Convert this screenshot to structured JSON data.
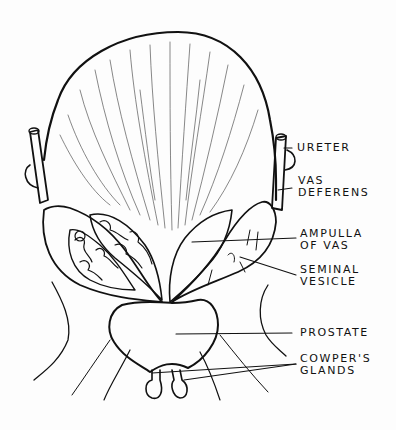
{
  "diagram": {
    "labels": {
      "ureter": {
        "line1": "URETER"
      },
      "vas_deferens": {
        "line1": "VAS",
        "line2": "DEFERENS"
      },
      "ampulla_of_vas": {
        "line1": "AMPULLA",
        "line2": "OF VAS"
      },
      "seminal_vesicle": {
        "line1": "SEMINAL",
        "line2": "VESICLE"
      },
      "prostate": {
        "line1": "PROSTATE"
      },
      "cowpers_glands": {
        "line1": "COWPER'S",
        "line2": "GLANDS"
      }
    },
    "colors": {
      "ink": "#111111",
      "background": "#fdfdfd",
      "shading": "#555555"
    }
  }
}
